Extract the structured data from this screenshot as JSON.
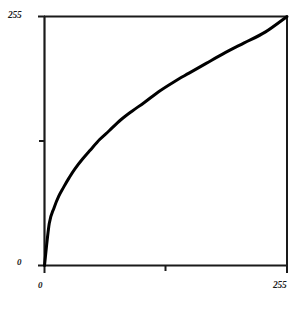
{
  "figure": {
    "background_color": "#ffffff",
    "ink_color": "#1a1a1a"
  },
  "axis_labels": {
    "y_max": "255",
    "y_min": "0",
    "x_min": "0",
    "x_max": "255"
  },
  "chart_data": {
    "type": "line",
    "title": "",
    "subtitle": "",
    "xlabel": "",
    "ylabel": "",
    "xlim": [
      0,
      255
    ],
    "ylim": [
      0,
      255
    ],
    "xticks": [
      0,
      128,
      255
    ],
    "yticks": [
      0,
      128,
      255
    ],
    "xticklabels": [
      "0",
      "",
      "255"
    ],
    "yticklabels": [
      "0",
      "",
      "255"
    ],
    "grid": false,
    "legend": null,
    "annotations": [],
    "line_color": "#000000",
    "line_width": 3,
    "series": [
      {
        "name": "gamma-curve",
        "exponent": 0.45,
        "x": [
          0,
          5,
          10,
          15,
          20,
          26,
          32,
          40,
          48,
          58,
          68,
          80,
          92,
          105,
          120,
          136,
          152,
          170,
          190,
          210,
          232,
          255
        ],
        "y": [
          0,
          43,
          59,
          71,
          80,
          90,
          99,
          109,
          118,
          129,
          138,
          149,
          158,
          167,
          178,
          188,
          197,
          207,
          218,
          228,
          239,
          255
        ]
      }
    ]
  }
}
